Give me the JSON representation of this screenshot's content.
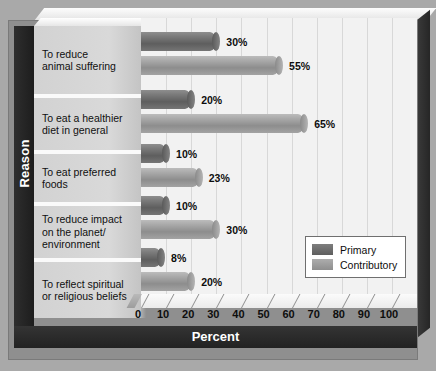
{
  "chart_data": {
    "type": "bar",
    "orientation": "horizontal",
    "title": "",
    "xlabel": "Percent",
    "ylabel": "Reason",
    "xlim": [
      0,
      100
    ],
    "xticks": [
      0,
      10,
      20,
      30,
      40,
      50,
      60,
      70,
      80,
      90,
      100
    ],
    "grid": true,
    "legend_position": "inside-bottom-right",
    "categories": [
      "To reduce animal suffering",
      "To eat a healthier diet in general",
      "To eat preferred foods",
      "To reduce impact on the planet/ environment",
      "To reflect spiritual or religious beliefs"
    ],
    "series": [
      {
        "name": "Primary",
        "color": "#6e6e6e",
        "values": [
          30,
          20,
          10,
          10,
          8
        ],
        "value_labels": [
          "30%",
          "20%",
          "10%",
          "10%",
          "8%"
        ]
      },
      {
        "name": "Contributory",
        "color": "#9c9c9c",
        "values": [
          55,
          65,
          23,
          30,
          20
        ],
        "value_labels": [
          "55%",
          "65%",
          "23%",
          "30%",
          "20%"
        ]
      }
    ]
  },
  "category_lines": [
    [
      "To reduce",
      "animal suffering"
    ],
    [
      "To eat a healthier",
      "diet in general"
    ],
    [
      "To eat preferred",
      "foods"
    ],
    [
      "To reduce impact",
      "on the planet/",
      "environment"
    ],
    [
      "To reflect spiritual",
      "or religious beliefs"
    ]
  ],
  "axes": {
    "y_title": "Reason",
    "x_title": "Percent",
    "x_tick_labels": [
      "0",
      "10",
      "20",
      "30",
      "40",
      "50",
      "60",
      "70",
      "80",
      "90",
      "100"
    ]
  },
  "legend": {
    "items": [
      {
        "label": "Primary",
        "color": "#6e6e6e"
      },
      {
        "label": "Contributory",
        "color": "#9c9c9c"
      }
    ]
  },
  "colors": {
    "page_background": "#a9a9a9",
    "panel_background": "#8f8f8f",
    "plot_background": "#f2f2f2",
    "axis_band": "#2a2a2a",
    "category_band": "#d6d6d6",
    "primary_bar": "#6e6e6e",
    "contributory_bar": "#9c9c9c"
  }
}
